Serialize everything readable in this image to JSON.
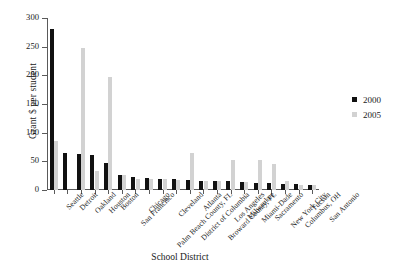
{
  "chart_data": {
    "type": "bar",
    "title": "",
    "xlabel": "School District",
    "ylabel": "Grant $ per student",
    "ylim": [
      0,
      300
    ],
    "yticks": [
      0,
      50,
      100,
      150,
      200,
      250,
      300
    ],
    "grid": false,
    "legend_position": "right",
    "categories": [
      "Seattle",
      "Detroit",
      "Oakland",
      "Houston",
      "Boston",
      "San Francisco",
      "Chicago",
      "Palm Beach County, FL",
      "Cleveland",
      "District of Columbia",
      "Atlanta",
      "Broward County, FL",
      "Los Angeles",
      "Milwaukee",
      "Miami-Dade",
      "Sacramento",
      "New York City",
      "Columbus, OH",
      "Tucson",
      "San Antonio"
    ],
    "series": [
      {
        "name": "2000",
        "color": "#111111",
        "values": [
          280,
          65,
          62,
          61,
          47,
          26,
          23,
          21,
          20,
          19,
          17,
          16,
          15,
          15,
          14,
          13,
          12,
          11,
          10,
          9
        ]
      },
      {
        "name": "2005",
        "color": "#d2d2d2",
        "values": [
          85,
          0,
          247,
          34,
          197,
          26,
          20,
          20,
          19,
          18,
          64,
          16,
          15,
          52,
          14,
          53,
          45,
          15,
          9,
          8
        ]
      }
    ]
  },
  "legend": {
    "items": [
      {
        "label": "2000",
        "color": "#111111"
      },
      {
        "label": "2005",
        "color": "#d2d2d2"
      }
    ]
  }
}
